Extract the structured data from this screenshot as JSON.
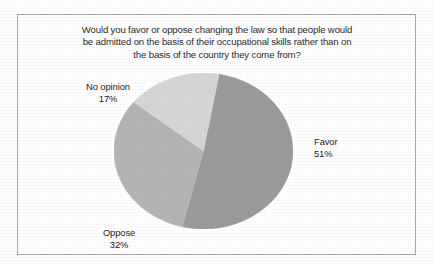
{
  "figure": {
    "clipped_text_above": "",
    "border_color": "#a9a9a9",
    "background_color": "#ffffff"
  },
  "chart_data": {
    "type": "pie",
    "title": "Would you favor or oppose changing the law so that people would be admitted on the basis of their occupational skills rather than on the basis of the country they come from?",
    "title_lines": [
      "Would you favor or oppose changing the law so that people would",
      "be admitted on the basis of their occupational skills rather than on",
      "the basis of the country they come from?"
    ],
    "xlabel": "",
    "ylabel": "",
    "legend": "none",
    "labels_position": "outside",
    "categories": [
      "Favor",
      "Oppose",
      "No opinion"
    ],
    "values": [
      51,
      32,
      17
    ],
    "value_labels": [
      "51%",
      "32%",
      "17%"
    ],
    "colors": [
      "#9a9a9a",
      "#b4b4b4",
      "#d6d6d6"
    ],
    "slices": [
      {
        "name": "Favor",
        "value": 51,
        "value_label": "51%",
        "color": "#9a9a9a"
      },
      {
        "name": "Oppose",
        "value": 32,
        "value_label": "32%",
        "color": "#b4b4b4"
      },
      {
        "name": "No opinion",
        "value": 17,
        "value_label": "17%",
        "color": "#d6d6d6"
      }
    ]
  },
  "labels": {
    "no_opinion": {
      "name": "No opinion",
      "value": "17%"
    },
    "favor": {
      "name": "Favor",
      "value": "51%"
    },
    "oppose": {
      "name": "Oppose",
      "value": "32%"
    }
  }
}
